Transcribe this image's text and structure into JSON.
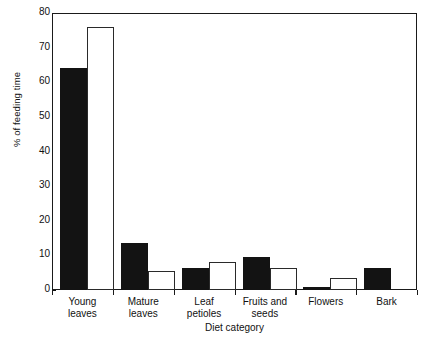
{
  "chart_data": {
    "type": "bar",
    "title": "",
    "xlabel": "Diet category",
    "ylabel": "% of feeding time",
    "categories": [
      "Young leaves",
      "Mature leaves",
      "Leaf petioles",
      "Fruits and seeds",
      "Flowers",
      "Bark"
    ],
    "category_lines": [
      [
        "Young",
        "leaves"
      ],
      [
        "Mature",
        "leaves"
      ],
      [
        "Leaf",
        "petioles"
      ],
      [
        "Fruits and",
        "seeds"
      ],
      [
        "Flowers",
        ""
      ],
      [
        "Bark",
        ""
      ]
    ],
    "series": [
      {
        "name": "filled",
        "style": "solid-black",
        "color": "#131313",
        "values": [
          64,
          13.5,
          6.5,
          9.5,
          1,
          6.5
        ]
      },
      {
        "name": "open",
        "style": "white-outline",
        "color": "#ffffff",
        "values": [
          76,
          5.5,
          8,
          6.5,
          3.5,
          0
        ]
      }
    ],
    "ylim": [
      0,
      80
    ],
    "yticks": [
      0,
      10,
      20,
      30,
      40,
      50,
      60,
      70,
      80
    ],
    "ytick_labels": [
      "0",
      "10",
      "20",
      "30",
      "40",
      "50",
      "60",
      "70",
      "80"
    ],
    "grid": false,
    "legend": "none",
    "frame": "full-box"
  }
}
